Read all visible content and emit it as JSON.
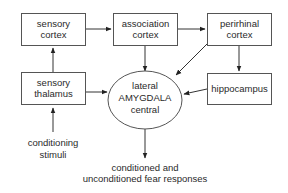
{
  "diagram": {
    "nodes": {
      "sensory_cortex": {
        "line1": "sensory",
        "line2": "cortex"
      },
      "association_cortex": {
        "line1": "association",
        "line2": "cortex"
      },
      "perirhinal_cortex": {
        "line1": "perirhinal",
        "line2": "cortex"
      },
      "sensory_thalamus": {
        "line1": "sensory",
        "line2": "thalamus"
      },
      "hippocampus": {
        "line1": "hippocampus"
      },
      "amygdala": {
        "line1": "lateral",
        "line2": "AMYGDALA",
        "line3": "central"
      }
    },
    "labels": {
      "input": {
        "line1": "conditioning",
        "line2": "stimuli"
      },
      "output": {
        "line1": "conditioned and",
        "line2": "unconditioned fear responses"
      }
    },
    "edges": [
      {
        "from": "conditioning stimuli",
        "to": "sensory thalamus"
      },
      {
        "from": "sensory thalamus",
        "to": "sensory cortex"
      },
      {
        "from": "sensory thalamus",
        "to": "lateral AMYGDALA central"
      },
      {
        "from": "sensory cortex",
        "to": "association cortex"
      },
      {
        "from": "association cortex",
        "to": "perirhinal cortex"
      },
      {
        "from": "association cortex",
        "to": "lateral AMYGDALA central"
      },
      {
        "from": "perirhinal cortex",
        "to": "lateral AMYGDALA central"
      },
      {
        "from": "perirhinal cortex",
        "to": "hippocampus"
      },
      {
        "from": "hippocampus",
        "to": "lateral AMYGDALA central"
      },
      {
        "from": "lateral AMYGDALA central",
        "to": "conditioned and unconditioned fear responses"
      }
    ],
    "colors": {
      "stroke": "#555555",
      "text": "#2a2a2a",
      "background": "#ffffff"
    }
  }
}
